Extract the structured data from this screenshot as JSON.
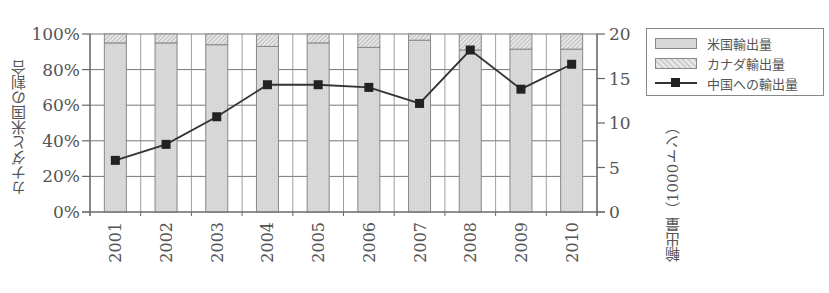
{
  "chart_data": {
    "type": "bar+line",
    "title": "",
    "categories": [
      "2001",
      "2002",
      "2003",
      "2004",
      "2005",
      "2006",
      "2007",
      "2008",
      "2009",
      "2010"
    ],
    "series": [
      {
        "name": "米国輸出量",
        "type": "stacked-bar-percent",
        "axis": "left",
        "values": [
          95,
          95,
          94,
          93,
          95,
          92.5,
          96.5,
          91,
          91.5,
          91.5
        ]
      },
      {
        "name": "カナダ輸出量",
        "type": "stacked-bar-percent",
        "axis": "left",
        "values": [
          5,
          5,
          6,
          7,
          5,
          7.5,
          3.5,
          9,
          8.5,
          8.5
        ]
      },
      {
        "name": "中国への輸出量",
        "type": "line",
        "axis": "right",
        "values": [
          5.8,
          7.6,
          10.7,
          14.3,
          14.3,
          14.0,
          12.2,
          18.2,
          13.8,
          16.6
        ]
      }
    ],
    "ylabel_left": "カナダと米国の割合",
    "ylabel_right": "輸出量（1000トン）",
    "xlabel": "",
    "yticks_left": [
      "0%",
      "20%",
      "40%",
      "60%",
      "80%",
      "100%"
    ],
    "yticks_right": [
      "0",
      "5",
      "10",
      "15",
      "20"
    ],
    "ylim_left": [
      0,
      100
    ],
    "ylim_right": [
      0,
      20
    ],
    "grid": true,
    "legend_position": "top-right, outside plot"
  },
  "legend": {
    "items": [
      {
        "label": "米国輸出量"
      },
      {
        "label": "カナダ輸出量"
      },
      {
        "label": "中国への輸出量"
      }
    ]
  },
  "axes": {
    "left_label": "カナダと米国の割合",
    "right_label": "輸出量（1000トン）"
  },
  "colors": {
    "us_bar": "#d8d8d8",
    "canada_bar": "#e4e4e4",
    "line": "#333333",
    "grid": "#777777"
  }
}
